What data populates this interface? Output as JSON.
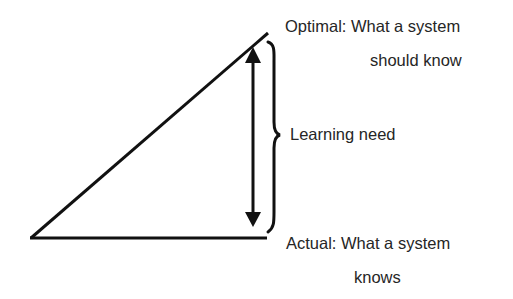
{
  "diagram": {
    "optimal": {
      "line1": "Optimal:  What a system",
      "line2": "should know"
    },
    "actual": {
      "line1": "Actual:  What a system",
      "line2": "knows"
    },
    "gap_label": "Learning need",
    "colors": {
      "stroke": "#111111",
      "text": "#262626",
      "background": "#ffffff"
    }
  }
}
